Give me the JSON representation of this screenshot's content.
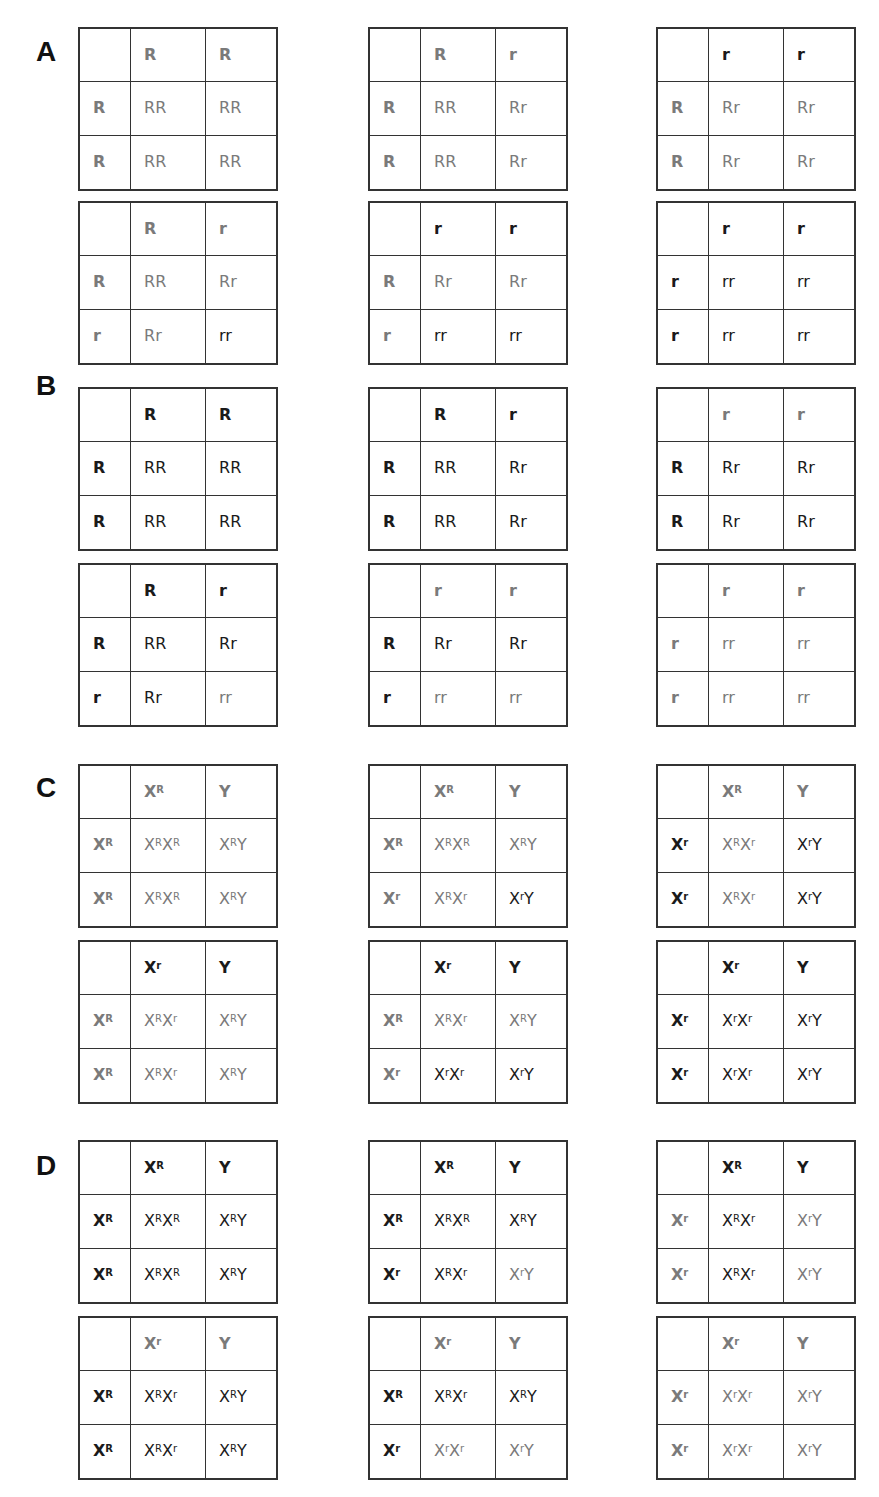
{
  "sections": [
    {
      "label": "A",
      "label_pos": [
        36,
        38
      ],
      "grids": [
        {
          "pos": [
            78,
            27
          ],
          "cells": [
            [
              "",
              "k"
            ],
            [
              "R",
              "g"
            ],
            [
              "R",
              "g"
            ],
            [
              "R",
              "g"
            ],
            [
              "RR",
              "g"
            ],
            [
              "RR",
              "g"
            ],
            [
              "R",
              "g"
            ],
            [
              "RR",
              "g"
            ],
            [
              "RR",
              "g"
            ]
          ]
        },
        {
          "pos": [
            368,
            27
          ],
          "cells": [
            [
              "",
              "k"
            ],
            [
              "R",
              "g"
            ],
            [
              "r",
              "g"
            ],
            [
              "R",
              "g"
            ],
            [
              "RR",
              "g"
            ],
            [
              "Rr",
              "g"
            ],
            [
              "R",
              "g"
            ],
            [
              "RR",
              "g"
            ],
            [
              "Rr",
              "g"
            ]
          ]
        },
        {
          "pos": [
            656,
            27
          ],
          "cells": [
            [
              "",
              "k"
            ],
            [
              "r",
              "k"
            ],
            [
              "r",
              "k"
            ],
            [
              "R",
              "g"
            ],
            [
              "Rr",
              "g"
            ],
            [
              "Rr",
              "g"
            ],
            [
              "R",
              "g"
            ],
            [
              "Rr",
              "g"
            ],
            [
              "Rr",
              "g"
            ]
          ]
        },
        {
          "pos": [
            78,
            201
          ],
          "cells": [
            [
              "",
              "k"
            ],
            [
              "R",
              "g"
            ],
            [
              "r",
              "g"
            ],
            [
              "R",
              "g"
            ],
            [
              "RR",
              "g"
            ],
            [
              "Rr",
              "g"
            ],
            [
              "r",
              "g"
            ],
            [
              "Rr",
              "g"
            ],
            [
              "rr",
              "k"
            ]
          ]
        },
        {
          "pos": [
            368,
            201
          ],
          "cells": [
            [
              "",
              "k"
            ],
            [
              "r",
              "k"
            ],
            [
              "r",
              "k"
            ],
            [
              "R",
              "g"
            ],
            [
              "Rr",
              "g"
            ],
            [
              "Rr",
              "g"
            ],
            [
              "r",
              "g"
            ],
            [
              "rr",
              "k"
            ],
            [
              "rr",
              "k"
            ]
          ]
        },
        {
          "pos": [
            656,
            201
          ],
          "cells": [
            [
              "",
              "k"
            ],
            [
              "r",
              "k"
            ],
            [
              "r",
              "k"
            ],
            [
              "r",
              "k"
            ],
            [
              "rr",
              "k"
            ],
            [
              "rr",
              "k"
            ],
            [
              "r",
              "k"
            ],
            [
              "rr",
              "k"
            ],
            [
              "rr",
              "k"
            ]
          ]
        }
      ]
    },
    {
      "label": "B",
      "label_pos": [
        36,
        372
      ],
      "grids": [
        {
          "pos": [
            78,
            387
          ],
          "cells": [
            [
              "",
              "k"
            ],
            [
              "R",
              "k"
            ],
            [
              "R",
              "k"
            ],
            [
              "R",
              "k"
            ],
            [
              "RR",
              "k"
            ],
            [
              "RR",
              "k"
            ],
            [
              "R",
              "k"
            ],
            [
              "RR",
              "k"
            ],
            [
              "RR",
              "k"
            ]
          ]
        },
        {
          "pos": [
            368,
            387
          ],
          "cells": [
            [
              "",
              "k"
            ],
            [
              "R",
              "k"
            ],
            [
              "r",
              "k"
            ],
            [
              "R",
              "k"
            ],
            [
              "RR",
              "k"
            ],
            [
              "Rr",
              "k"
            ],
            [
              "R",
              "k"
            ],
            [
              "RR",
              "k"
            ],
            [
              "Rr",
              "k"
            ]
          ]
        },
        {
          "pos": [
            656,
            387
          ],
          "cells": [
            [
              "",
              "k"
            ],
            [
              "r",
              "g"
            ],
            [
              "r",
              "g"
            ],
            [
              "R",
              "k"
            ],
            [
              "Rr",
              "k"
            ],
            [
              "Rr",
              "k"
            ],
            [
              "R",
              "k"
            ],
            [
              "Rr",
              "k"
            ],
            [
              "Rr",
              "k"
            ]
          ]
        },
        {
          "pos": [
            78,
            563
          ],
          "cells": [
            [
              "",
              "k"
            ],
            [
              "R",
              "k"
            ],
            [
              "r",
              "k"
            ],
            [
              "R",
              "k"
            ],
            [
              "RR",
              "k"
            ],
            [
              "Rr",
              "k"
            ],
            [
              "r",
              "k"
            ],
            [
              "Rr",
              "k"
            ],
            [
              "rr",
              "g"
            ]
          ]
        },
        {
          "pos": [
            368,
            563
          ],
          "cells": [
            [
              "",
              "k"
            ],
            [
              "r",
              "g"
            ],
            [
              "r",
              "g"
            ],
            [
              "R",
              "k"
            ],
            [
              "Rr",
              "k"
            ],
            [
              "Rr",
              "k"
            ],
            [
              "r",
              "k"
            ],
            [
              "rr",
              "g"
            ],
            [
              "rr",
              "g"
            ]
          ]
        },
        {
          "pos": [
            656,
            563
          ],
          "cells": [
            [
              "",
              "k"
            ],
            [
              "r",
              "g"
            ],
            [
              "r",
              "g"
            ],
            [
              "r",
              "g"
            ],
            [
              "rr",
              "g"
            ],
            [
              "rr",
              "g"
            ],
            [
              "r",
              "g"
            ],
            [
              "rr",
              "g"
            ],
            [
              "rr",
              "g"
            ]
          ]
        }
      ]
    },
    {
      "label": "C",
      "label_pos": [
        36,
        774
      ],
      "grids": [
        {
          "pos": [
            78,
            764
          ],
          "cells": [
            [
              "",
              "k"
            ],
            [
              "X^R",
              "g"
            ],
            [
              "Y",
              "g"
            ],
            [
              "X^R",
              "g"
            ],
            [
              "X^RX^R",
              "g"
            ],
            [
              "X^RY",
              "g"
            ],
            [
              "X^R",
              "g"
            ],
            [
              "X^RX^R",
              "g"
            ],
            [
              "X^RY",
              "g"
            ]
          ]
        },
        {
          "pos": [
            368,
            764
          ],
          "cells": [
            [
              "",
              "k"
            ],
            [
              "X^R",
              "g"
            ],
            [
              "Y",
              "g"
            ],
            [
              "X^R",
              "g"
            ],
            [
              "X^R X^R",
              "g"
            ],
            [
              "X^RY",
              "g"
            ],
            [
              "X^r",
              "g"
            ],
            [
              "X^RX^r",
              "g"
            ],
            [
              "X^rY",
              "k"
            ]
          ]
        },
        {
          "pos": [
            656,
            764
          ],
          "cells": [
            [
              "",
              "k"
            ],
            [
              "X^R",
              "g"
            ],
            [
              "Y",
              "g"
            ],
            [
              "X^r",
              "k"
            ],
            [
              "X^RX^r",
              "g"
            ],
            [
              "X^rY",
              "k"
            ],
            [
              "X^r",
              "k"
            ],
            [
              "X^RX^r",
              "g"
            ],
            [
              "X^rY",
              "k"
            ]
          ]
        },
        {
          "pos": [
            78,
            940
          ],
          "cells": [
            [
              "",
              "k"
            ],
            [
              "X^r",
              "k"
            ],
            [
              "Y",
              "k"
            ],
            [
              "X^R",
              "g"
            ],
            [
              "X^RX^r",
              "g"
            ],
            [
              "X^RY",
              "g"
            ],
            [
              "X^R",
              "g"
            ],
            [
              "X^RX^r",
              "g"
            ],
            [
              "X^RY",
              "g"
            ]
          ]
        },
        {
          "pos": [
            368,
            940
          ],
          "cells": [
            [
              "",
              "k"
            ],
            [
              "X^r",
              "k"
            ],
            [
              "Y",
              "k"
            ],
            [
              "X^R",
              "g"
            ],
            [
              "X^RX^r",
              "g"
            ],
            [
              "X^RY",
              "g"
            ],
            [
              "X^r",
              "g"
            ],
            [
              "X^rX^r",
              "k"
            ],
            [
              "X^rY",
              "k"
            ]
          ]
        },
        {
          "pos": [
            656,
            940
          ],
          "cells": [
            [
              "",
              "k"
            ],
            [
              "X^r",
              "k"
            ],
            [
              "Y",
              "k"
            ],
            [
              "X^r",
              "k"
            ],
            [
              "X^rX^r",
              "k"
            ],
            [
              "X^rY",
              "k"
            ],
            [
              "X^r",
              "k"
            ],
            [
              "X^rX^r",
              "k"
            ],
            [
              "X^rY",
              "k"
            ]
          ]
        }
      ]
    },
    {
      "label": "D",
      "label_pos": [
        36,
        1152
      ],
      "grids": [
        {
          "pos": [
            78,
            1140
          ],
          "cells": [
            [
              "",
              "k"
            ],
            [
              "X^R",
              "k"
            ],
            [
              "Y",
              "k"
            ],
            [
              "X^R",
              "k"
            ],
            [
              "X^RX^R",
              "k"
            ],
            [
              "X^RY",
              "k"
            ],
            [
              "X^R",
              "k"
            ],
            [
              "X^RX^R",
              "k"
            ],
            [
              "X^RY",
              "k"
            ]
          ]
        },
        {
          "pos": [
            368,
            1140
          ],
          "cells": [
            [
              "",
              "k"
            ],
            [
              "X^R",
              "k"
            ],
            [
              "Y",
              "k"
            ],
            [
              "X^R",
              "k"
            ],
            [
              "X^RX^R",
              "k"
            ],
            [
              "X^RY",
              "k"
            ],
            [
              "X^r",
              "k"
            ],
            [
              "X^RX^r",
              "k"
            ],
            [
              "X^rY",
              "g"
            ]
          ]
        },
        {
          "pos": [
            656,
            1140
          ],
          "cells": [
            [
              "",
              "k"
            ],
            [
              "X^R",
              "k"
            ],
            [
              "Y",
              "k"
            ],
            [
              "X^r",
              "g"
            ],
            [
              "X^RX^r",
              "k"
            ],
            [
              "X^rY",
              "g"
            ],
            [
              "X^r",
              "g"
            ],
            [
              "X^RX^r",
              "k"
            ],
            [
              "X^rY",
              "g"
            ]
          ]
        },
        {
          "pos": [
            78,
            1316
          ],
          "cells": [
            [
              "",
              "k"
            ],
            [
              "X^r",
              "g"
            ],
            [
              "Y",
              "g"
            ],
            [
              "X^R",
              "k"
            ],
            [
              "X^RX^r",
              "k"
            ],
            [
              "X^RY",
              "k"
            ],
            [
              "X^R",
              "k"
            ],
            [
              "X^RX^r",
              "k"
            ],
            [
              "X^RY",
              "k"
            ]
          ]
        },
        {
          "pos": [
            368,
            1316
          ],
          "cells": [
            [
              "",
              "k"
            ],
            [
              "X^r",
              "g"
            ],
            [
              "Y",
              "g"
            ],
            [
              "X^R",
              "k"
            ],
            [
              "X^RX^r",
              "k"
            ],
            [
              "X^RY",
              "k"
            ],
            [
              "X^r",
              "k"
            ],
            [
              "X^rX^r",
              "g"
            ],
            [
              "X^rY",
              "g"
            ]
          ]
        },
        {
          "pos": [
            656,
            1316
          ],
          "cells": [
            [
              "",
              "k"
            ],
            [
              "X^r",
              "g"
            ],
            [
              "Y",
              "g"
            ],
            [
              "X^r",
              "g"
            ],
            [
              "X^rX^r",
              "g"
            ],
            [
              "X^rY",
              "g"
            ],
            [
              "X^r",
              "g"
            ],
            [
              "X^rX^r",
              "g"
            ],
            [
              "X^rY",
              "g"
            ]
          ]
        }
      ]
    }
  ],
  "colors": {
    "gray": "#7a7a7a",
    "black": "#1a1a1a",
    "border": "#333333"
  }
}
